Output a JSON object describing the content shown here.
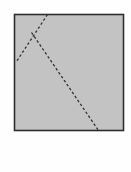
{
  "figure": {
    "name": "dashed-fold-lines-on-gray-square",
    "canvas": {
      "width": 131,
      "height": 172,
      "background": "#fefefe"
    },
    "square": {
      "name": "gray-square",
      "x": 14.5,
      "y": 14.5,
      "width": 109,
      "height": 116,
      "fill": "#c3c3c3",
      "stroke": "#2e2e2e",
      "stroke_width": 1.6
    },
    "dashed_lines": [
      {
        "name": "upper-left-crease",
        "label": "crease-1",
        "x1": 47.5,
        "y1": 14.5,
        "x2": 16.5,
        "y2": 61.5,
        "stroke": "#333333",
        "stroke_width": 1.3,
        "dash": "2.6 2.2"
      },
      {
        "name": "long-diagonal-crease",
        "label": "crease-2",
        "x1": 31.5,
        "y1": 32.5,
        "x2": 98.5,
        "y2": 130.5,
        "stroke": "#333333",
        "stroke_width": 1.3,
        "dash": "2.6 2.2"
      }
    ],
    "apex": {
      "name": "crease-intersection",
      "x": 34,
      "y": 37
    }
  },
  "caption": {
    "symbol": "(",
    "name": "open-parenthesis"
  },
  "colors": {
    "square_fill": "#c3c3c3",
    "square_border": "#2e2e2e",
    "crease_line": "#333333",
    "caption_text": "#3a3a3a",
    "page_background": "#fefefe"
  }
}
